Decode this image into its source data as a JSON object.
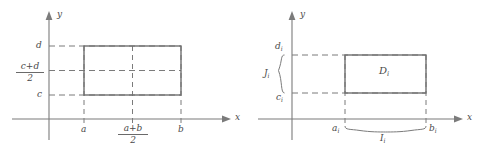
{
  "figure": {
    "caption": "",
    "background_color": "#ffffff",
    "line_color": "#777777",
    "text_color": "#4a4a4a",
    "panels": [
      {
        "id": "left",
        "name": "rectangle-with-midlines",
        "axes": {
          "x_label": "x",
          "y_label": "y",
          "x_arrow": true,
          "y_arrow": true
        },
        "x_ticks": [
          {
            "label": "a",
            "kind": "plain"
          },
          {
            "label": "(a+b)/2",
            "kind": "fraction",
            "numerator": "a+b",
            "denominator": "2"
          },
          {
            "label": "b",
            "kind": "plain"
          }
        ],
        "y_ticks": [
          {
            "label": "d",
            "kind": "plain"
          },
          {
            "label": "(c+d)/2",
            "kind": "fraction",
            "numerator": "c+d",
            "denominator": "2"
          },
          {
            "label": "c",
            "kind": "plain"
          }
        ],
        "rectangle": {
          "name": "rectangle-abcd",
          "x_from": "a",
          "x_to": "b",
          "y_from": "c",
          "y_to": "d"
        },
        "midlines": {
          "vertical": "(a+b)/2",
          "horizontal": "(c+d)/2"
        }
      },
      {
        "id": "right",
        "name": "rectangle-D-i-with-braces",
        "axes": {
          "x_label": "x",
          "y_label": "y",
          "x_arrow": true,
          "y_arrow": true
        },
        "x_ticks": [
          {
            "label": "a",
            "sub": "i",
            "kind": "subscript"
          },
          {
            "label": "b",
            "sub": "i",
            "kind": "subscript"
          }
        ],
        "y_ticks": [
          {
            "label": "d",
            "sub": "i",
            "kind": "subscript"
          },
          {
            "label": "c",
            "sub": "i",
            "kind": "subscript"
          }
        ],
        "rectangle": {
          "name": "rectangle-D-i",
          "interior_label": "D",
          "interior_sub": "i",
          "x_from": "a_i",
          "x_to": "b_i",
          "y_from": "c_i",
          "y_to": "d_i"
        },
        "braces": [
          {
            "name": "vertical-brace-J-i",
            "orientation": "vertical",
            "label": "J",
            "sub": "i",
            "spans": "c_i to d_i"
          },
          {
            "name": "horizontal-brace-I-i",
            "orientation": "horizontal",
            "label": "I",
            "sub": "i",
            "spans": "a_i to b_i"
          }
        ]
      }
    ]
  }
}
